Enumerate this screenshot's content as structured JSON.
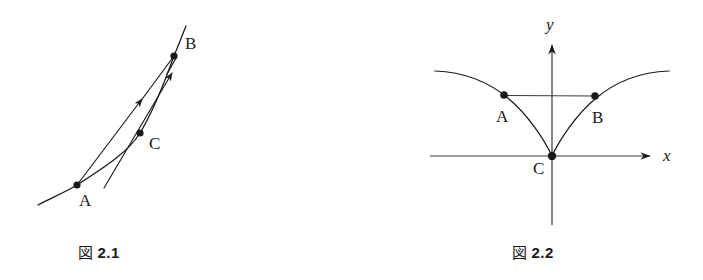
{
  "page": {
    "width": 703,
    "height": 280,
    "background": "#ffffff",
    "ink_color": "#1a1a1a"
  },
  "figures": [
    {
      "id": "fig-2-1",
      "caption_kanji": "図",
      "caption_number": "2.1",
      "caption_full": "図 2.1",
      "description": "Curve through points A, C, B with a secant chord A-B and a second straight line, both drawn with arrowheads pointing up-right toward B",
      "points": [
        {
          "name": "A",
          "label": "A",
          "x": 77,
          "y": 185,
          "label_x": 80,
          "label_y": 193
        },
        {
          "name": "C",
          "label": "C",
          "x": 140,
          "y": 133,
          "label_x": 150,
          "label_y": 136
        },
        {
          "name": "B",
          "label": "B",
          "x": 174,
          "y": 56,
          "label_x": 186,
          "label_y": 36
        }
      ],
      "curve": {
        "type": "smooth-increasing-convex",
        "path": "M 38,205 C 60,194 70,190 77,185 C 110,163 130,150 140,133 C 155,108 165,80 174,56 C 178,46 182,36 186,26"
      },
      "lines": [
        {
          "name": "secant-A-B",
          "from": [
            77,
            185
          ],
          "to": [
            174,
            56
          ],
          "arrowhead": "mid-upper",
          "arrow_at": [
            138,
            104
          ]
        },
        {
          "name": "secant-lower-B",
          "from": [
            104,
            187
          ],
          "to": [
            174,
            56
          ],
          "arrowhead": "mid-upper",
          "arrow_at": [
            176,
            78
          ]
        }
      ]
    },
    {
      "id": "fig-2-2",
      "caption_kanji": "図",
      "caption_number": "2.2",
      "caption_full": "図 2.2",
      "description": "Cusp curve y = |x|^(2/3)-like graph on x-y axes, with points A and B at equal height joined by a horizontal segment and point C at the origin cusp",
      "axes": {
        "x_axis": {
          "label": "x",
          "y": 156,
          "x_start": 430,
          "x_end": 655,
          "label_x": 663,
          "label_y": 149
        },
        "y_axis": {
          "label": "y",
          "x": 552,
          "y_top": 40,
          "y_bottom": 225,
          "label_x": 546,
          "label_y": 18
        }
      },
      "points": [
        {
          "name": "A",
          "label": "A",
          "x": 504,
          "y": 95,
          "label_x": 496,
          "label_y": 110
        },
        {
          "name": "B",
          "label": "B",
          "x": 595,
          "y": 96,
          "label_x": 592,
          "label_y": 111
        },
        {
          "name": "C",
          "label": "C",
          "x": 552,
          "y": 156,
          "label_x": 533,
          "label_y": 162
        }
      ],
      "curve": {
        "type": "cusp-at-origin",
        "left_path": "M 435,71 C 470,73 495,84 515,104 C 532,121 545,140 552,156",
        "right_path": "M 552,156 C 559,140 572,121 589,104 C 609,84 634,73 668,71"
      },
      "segments": [
        {
          "name": "chord-A-B",
          "from": [
            504,
            95
          ],
          "to": [
            595,
            96
          ]
        }
      ]
    }
  ],
  "captions": [
    {
      "for": "fig-2-1",
      "kanji": "図",
      "number": "2.1",
      "x": 78,
      "y": 241
    },
    {
      "for": "fig-2-2",
      "kanji": "図",
      "number": "2.2",
      "x": 512,
      "y": 241
    }
  ]
}
